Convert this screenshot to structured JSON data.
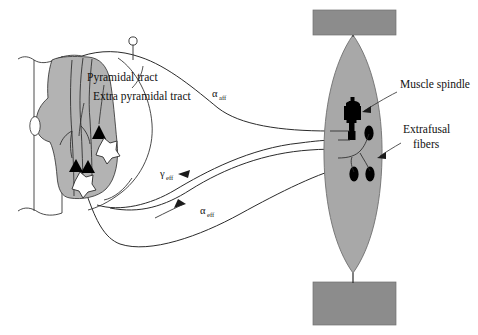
{
  "figure": {
    "background_color": "#ffffff"
  },
  "colors": {
    "gray_matter": "#b3b3b3",
    "muscle_body": "#a8a8a8",
    "tendon_block": "#8c8c8c",
    "spindle_black": "#000000",
    "fiber_black": "#000000",
    "line": "#2b2b2b",
    "text": "#111111",
    "white_fill": "#ffffff"
  },
  "labels": {
    "pyramidal_tract": "Pyramidal tract",
    "extra_pyramidal_tract": "Extra pyramidal tract",
    "muscle_spindle": "Muscle spindle",
    "extrafusal_line1": "Extrafusal",
    "extrafusal_line2": "fibers",
    "alpha_afferent_symbol": "α",
    "alpha_afferent_subscript": "aff",
    "gamma_efferent_symbol": "γ",
    "gamma_efferent_subscript": "eff",
    "alpha_efferent_symbol": "α",
    "alpha_efferent_subscript": "eff"
  },
  "structures": {
    "spinal_cord": {
      "name": "spinal-cord-cross-section",
      "gray_matter_label": "gray matter butterfly",
      "central_canal_label": "central canal"
    },
    "dorsal_root_ganglion": {
      "name": "dorsal-root-ganglion",
      "shape": "circle-on-stem"
    },
    "neuron_symbols": {
      "synapse_triangles": 3,
      "motor_neuron_stars": 2
    },
    "muscle": {
      "name": "skeletal-muscle-belly",
      "shape": "fusiform"
    },
    "tendons": {
      "top": "upper-tendon-attachment",
      "bottom": "lower-tendon-attachment"
    },
    "spindle": {
      "name": "intrafusal-muscle-spindle",
      "count": 1
    },
    "extrafusal_fibers": {
      "count": 3
    }
  },
  "pathways": [
    {
      "id": "alpha-afferent",
      "label": "αaff",
      "direction": "muscle-to-cord",
      "type": "sensory"
    },
    {
      "id": "gamma-efferent",
      "label": "γeff",
      "direction": "cord-to-muscle",
      "type": "motor"
    },
    {
      "id": "alpha-efferent",
      "label": "αeff",
      "direction": "cord-to-muscle",
      "type": "motor"
    }
  ]
}
